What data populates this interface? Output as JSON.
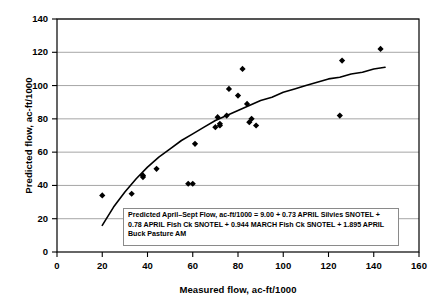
{
  "chart_data": {
    "type": "scatter",
    "title": "",
    "xlabel": "Measured flow, ac-ft/1000",
    "ylabel": "Predicted flow, ac-ft/1000",
    "xlim": [
      0,
      160
    ],
    "ylim": [
      0,
      140
    ],
    "xticks": [
      0,
      20,
      40,
      60,
      80,
      100,
      120,
      140,
      160
    ],
    "yticks": [
      0,
      20,
      40,
      60,
      80,
      100,
      120,
      140
    ],
    "grid": "horizontal",
    "legend": "none",
    "marker": "filled-diamond",
    "marker_color": "#000000",
    "series": [
      {
        "name": "observations",
        "points": [
          [
            20,
            34
          ],
          [
            33,
            35
          ],
          [
            38,
            46
          ],
          [
            38,
            45
          ],
          [
            44,
            50
          ],
          [
            58,
            41
          ],
          [
            60,
            41
          ],
          [
            61,
            65
          ],
          [
            70,
            75
          ],
          [
            71,
            81
          ],
          [
            72,
            76
          ],
          [
            72,
            77
          ],
          [
            75,
            82
          ],
          [
            76,
            98
          ],
          [
            80,
            94
          ],
          [
            82,
            110
          ],
          [
            84,
            89
          ],
          [
            85,
            78
          ],
          [
            86,
            80
          ],
          [
            88,
            76
          ],
          [
            125,
            82
          ],
          [
            126,
            115
          ],
          [
            143,
            122
          ]
        ]
      }
    ],
    "fit_curve": {
      "name": "fitted regression curve",
      "points": [
        [
          20,
          16
        ],
        [
          25,
          27
        ],
        [
          30,
          36
        ],
        [
          35,
          44
        ],
        [
          40,
          51
        ],
        [
          45,
          57
        ],
        [
          50,
          62
        ],
        [
          55,
          67
        ],
        [
          60,
          71
        ],
        [
          65,
          75
        ],
        [
          70,
          79
        ],
        [
          75,
          82
        ],
        [
          80,
          85
        ],
        [
          85,
          88
        ],
        [
          90,
          91
        ],
        [
          95,
          93
        ],
        [
          100,
          96
        ],
        [
          105,
          98
        ],
        [
          110,
          100
        ],
        [
          115,
          102
        ],
        [
          120,
          104
        ],
        [
          125,
          105
        ],
        [
          130,
          107
        ],
        [
          135,
          108
        ],
        [
          140,
          110
        ],
        [
          145,
          111
        ]
      ]
    },
    "annotation": {
      "id": "equation-box",
      "lines": [
        "Predicted April–Sept Flow, ac-ft/1000 = 9.00 + 0.73 APRIL Silvies SNOTEL +",
        "0.78 APRIL Fish Ck SNOTEL +  0.944 MARCH Fish Ck SNOTEL + 1.895 APRIL",
        "Buck Pasture AM"
      ]
    }
  }
}
